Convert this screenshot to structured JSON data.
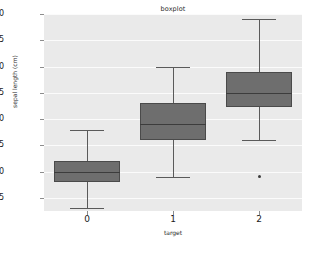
{
  "chart_data": {
    "type": "box",
    "title": "boxplot",
    "xlabel": "target",
    "ylabel": "sepal length (cm)",
    "categories": [
      "0",
      "1",
      "2"
    ],
    "xtick_labels": [
      "0",
      "1",
      "2"
    ],
    "ytick_labels": [
      "4.5",
      "5.0",
      "5.5",
      "6.0",
      "6.5",
      "7.0",
      "7.5",
      "8.0"
    ],
    "ytick_values": [
      4.5,
      5.0,
      5.5,
      6.0,
      6.5,
      7.0,
      7.5,
      8.0
    ],
    "ylim": [
      4.25,
      8.0
    ],
    "grid": true,
    "legend": false,
    "boxes": [
      {
        "label": "0",
        "whisker_low": 4.3,
        "q1": 4.8,
        "median": 5.0,
        "q3": 5.2,
        "whisker_high": 5.8,
        "fliers": []
      },
      {
        "label": "1",
        "whisker_low": 4.9,
        "q1": 5.6,
        "median": 5.9,
        "q3": 6.3,
        "whisker_high": 7.0,
        "fliers": []
      },
      {
        "label": "2",
        "whisker_low": 5.6,
        "q1": 6.225,
        "median": 6.5,
        "q3": 6.9,
        "whisker_high": 7.9,
        "fliers": [
          4.9
        ]
      }
    ],
    "colors": {
      "box_fill": "#6e6e6e",
      "box_edge": "#4a4a4a",
      "median": "#3c3c3c",
      "whisker": "#5a5a5a",
      "flier": "#3c3c3c",
      "axes_background": "#eaeaea",
      "grid": "#fbfbfb",
      "figure_background": "#ffffff",
      "text": "#1a1a1a"
    }
  }
}
